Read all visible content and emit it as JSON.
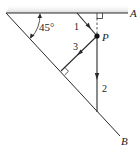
{
  "diagram": {
    "type": "statics-force-diagram",
    "labels": {
      "angle": "45°",
      "point": "P",
      "wall_top": "A",
      "wall_diagonal": "B",
      "force_1": "1",
      "force_2": "2",
      "force_3": "3"
    },
    "colors": {
      "line": "#2a2a2a",
      "text": "#222222",
      "shade": "#d8d8d8",
      "background": "#ffffff"
    },
    "elements": {
      "wall_top_line": {
        "from": [
          6,
          13
        ],
        "to": [
          128,
          13
        ],
        "label": "A"
      },
      "wall_diagonal_line": {
        "from": [
          6,
          13
        ],
        "to": [
          120,
          136
        ],
        "label": "B"
      },
      "angle_between_walls": "45°",
      "point_P": [
        97,
        36
      ],
      "force_vectors": [
        {
          "id": "1",
          "from": [
            77,
            13
          ],
          "to": [
            97,
            36
          ],
          "arrow_direction": "toward P"
        },
        {
          "id": "2",
          "from": [
            97,
            36
          ],
          "to": [
            97,
            112
          ],
          "arrow_direction": "downward"
        },
        {
          "id": "3",
          "from": [
            97,
            36
          ],
          "to": [
            61,
            71
          ],
          "arrow_direction": "toward diagonal wall",
          "perpendicular_to": "B"
        }
      ],
      "dashed_perpendicular": {
        "from": [
          97,
          36
        ],
        "to": [
          97,
          13
        ],
        "perpendicular_to": "A"
      }
    }
  }
}
